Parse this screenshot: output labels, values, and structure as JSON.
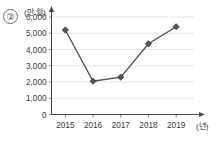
{
  "figure": {
    "item_number": "②",
    "y_axis_unit": "(만 원)",
    "x_axis_unit": "(년)"
  },
  "chart_data": {
    "type": "line",
    "title": "",
    "xlabel": "(년)",
    "ylabel": "(만 원)",
    "categories": [
      "2015",
      "2016",
      "2017",
      "2018",
      "2019"
    ],
    "values": [
      5200,
      2050,
      2300,
      4350,
      5400
    ],
    "series": [
      {
        "name": "금액",
        "values": [
          5200,
          2050,
          2300,
          4350,
          5400
        ]
      }
    ],
    "ylim": [
      0,
      6000
    ],
    "y_ticks": [
      0,
      1000,
      2000,
      3000,
      4000,
      5000,
      6000
    ],
    "y_tick_labels": [
      "0",
      "1,000",
      "2,000",
      "3,000",
      "4,000",
      "5,000",
      "6,000"
    ],
    "x_tick_labels": [
      "2015",
      "2016",
      "2017",
      "2018",
      "2019"
    ],
    "grid": "horizontal",
    "legend": "none",
    "marker": "diamond",
    "line_color": "#4d4d4d",
    "marker_color": "#555555",
    "grid_color": "#d8d8d8",
    "axis_color": "#4a4a4a"
  }
}
